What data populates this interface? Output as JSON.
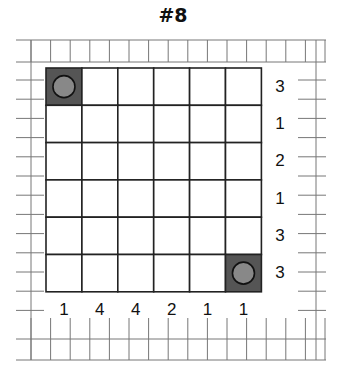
{
  "puzzle": {
    "title": "#8",
    "rows": 6,
    "cols": 6,
    "row_clues": [
      "3",
      "1",
      "2",
      "1",
      "3",
      "3"
    ],
    "col_clues": [
      "1",
      "4",
      "4",
      "2",
      "1",
      "1"
    ],
    "filled_cells": [
      {
        "row": 0,
        "col": 0,
        "marker": "circle"
      },
      {
        "row": 5,
        "col": 5,
        "marker": "circle"
      }
    ],
    "colors": {
      "grid_line": "#222222",
      "paper_line": "#777777",
      "filled_cell": "#555555",
      "circle": "#888888"
    }
  }
}
